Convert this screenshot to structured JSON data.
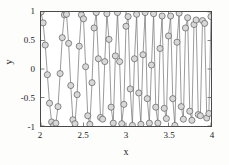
{
  "chart_data": {
    "type": "line",
    "title": "",
    "subtitle": "",
    "xlabel": "x",
    "ylabel": "y",
    "xlim": [
      2,
      4
    ],
    "ylim": [
      -1,
      1
    ],
    "xticks": [
      2,
      2.5,
      3,
      3.5,
      4
    ],
    "xtick_labels": [
      "2",
      "2.5",
      "3",
      "3.5",
      "4"
    ],
    "yticks": [
      -1,
      -0.5,
      0,
      0.5,
      1
    ],
    "ytick_labels": [
      "-1",
      "-0.5",
      "0",
      "0.5",
      "1"
    ],
    "grid": false,
    "legend": null,
    "legend_position": "none",
    "marker": "circle",
    "marker_size": 3.1,
    "line_color": "#6e6e6e",
    "marker_edge_color": "#5a5a5a",
    "marker_face_color": "#d8d8d8",
    "axis_color": "#4a4a4a",
    "series": [
      {
        "name": "y",
        "x": [
          2.0,
          2.025,
          2.05,
          2.075,
          2.1,
          2.125,
          2.15,
          2.175,
          2.2,
          2.225,
          2.25,
          2.275,
          2.3,
          2.325,
          2.35,
          2.375,
          2.4,
          2.425,
          2.45,
          2.475,
          2.5,
          2.525,
          2.55,
          2.575,
          2.6,
          2.625,
          2.65,
          2.675,
          2.7,
          2.725,
          2.75,
          2.775,
          2.8,
          2.825,
          2.85,
          2.875,
          2.9,
          2.925,
          2.95,
          2.975,
          3.0,
          3.025,
          3.05,
          3.075,
          3.1,
          3.125,
          3.15,
          3.175,
          3.2,
          3.225,
          3.25,
          3.275,
          3.3,
          3.325,
          3.35,
          3.375,
          3.4,
          3.425,
          3.45,
          3.475,
          3.5,
          3.525,
          3.55,
          3.575,
          3.6,
          3.625,
          3.65,
          3.675,
          3.7,
          3.725,
          3.75,
          3.775,
          3.8,
          3.825,
          3.85,
          3.875,
          3.9,
          3.925,
          3.95,
          3.975,
          4.0
        ],
        "y": [
          1.0,
          0.81,
          0.42,
          -0.1,
          -0.6,
          -0.93,
          -0.99,
          -0.95,
          -0.66,
          -0.08,
          0.55,
          0.95,
          0.96,
          0.45,
          -0.29,
          -0.89,
          -0.96,
          -0.45,
          0.4,
          0.95,
          0.88,
          0.04,
          -0.82,
          -0.97,
          -0.24,
          0.72,
          0.99,
          0.18,
          -0.85,
          -0.88,
          0.13,
          0.97,
          0.52,
          -0.67,
          -0.95,
          0.23,
          0.99,
          0.13,
          -0.96,
          -0.62,
          0.75,
          0.92,
          -0.35,
          -0.99,
          0.18,
          0.96,
          -0.42,
          -0.97,
          0.25,
          0.99,
          -0.52,
          -0.95,
          0.07,
          0.97,
          -0.67,
          -0.95,
          0.36,
          0.93,
          -0.69,
          -0.87,
          0.58,
          0.93,
          -0.52,
          -0.99,
          0.47,
          0.98,
          -0.66,
          -0.88,
          0.72,
          0.9,
          -0.74,
          -0.9,
          0.78,
          0.86,
          -0.8,
          -0.82,
          0.85,
          0.8,
          -0.86,
          -0.78,
          0.92
        ]
      }
    ]
  },
  "axes": {
    "ylabel": "y",
    "xlabel": "x",
    "xtick_labels": [
      "2",
      "2.5",
      "3",
      "3.5",
      "4"
    ],
    "ytick_labels": [
      "1",
      "0.5",
      "0",
      "-0.5",
      "-1"
    ]
  }
}
